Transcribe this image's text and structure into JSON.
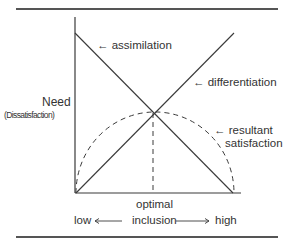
{
  "diagram": {
    "y_axis_label": "Need",
    "y_axis_sublabel": "(Dissatisfaction)",
    "x_axis": {
      "low_label": "low",
      "center_label": "inclusion",
      "high_label": "high",
      "marker_label": "optimal"
    },
    "curves": [
      {
        "name": "assimilation",
        "label": "← assimilation",
        "style": "solid",
        "direction": "decreasing"
      },
      {
        "name": "differentiation",
        "label": "← differentiation",
        "style": "solid",
        "direction": "increasing"
      },
      {
        "name": "resultant-satisfaction",
        "label_line1": "← resultant",
        "label_line2": "satisfaction",
        "style": "dashed",
        "shape": "semicircle"
      }
    ],
    "colors": {
      "line": "#3a3a3a",
      "text": "#333333",
      "rule": "#555555"
    }
  }
}
